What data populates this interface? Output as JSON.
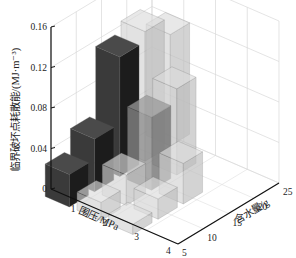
{
  "chart_data": {
    "type": "bar3d",
    "title": "",
    "ylabel": "临界破坏点耗散能/(MJ·m⁻³)",
    "xlabel": "围压/MPa",
    "zlabel": "含水量/g",
    "x_ticks": [
      "1",
      "2",
      "3",
      "4"
    ],
    "z_ticks": [
      "5",
      "10",
      "15",
      "20",
      "25"
    ],
    "y_ticks": [
      "0",
      "0.04",
      "0.08",
      "0.12",
      "0.16"
    ],
    "ylim": [
      0,
      0.16
    ],
    "grid": true,
    "bars": [
      {
        "pressure": 1,
        "water": 5,
        "value": 0.032,
        "shade": "dark"
      },
      {
        "pressure": 2,
        "water": 5,
        "value": 0.018,
        "shade": "light"
      },
      {
        "pressure": 3,
        "water": 5,
        "value": 0.01,
        "shade": "light"
      },
      {
        "pressure": 1,
        "water": 10,
        "value": 0.052,
        "shade": "dark"
      },
      {
        "pressure": 2,
        "water": 10,
        "value": 0.03,
        "shade": "light"
      },
      {
        "pressure": 3,
        "water": 10,
        "value": 0.02,
        "shade": "light"
      },
      {
        "pressure": 1,
        "water": 15,
        "value": 0.118,
        "shade": "dark"
      },
      {
        "pressure": 2,
        "water": 15,
        "value": 0.072,
        "shade": "medium"
      },
      {
        "pressure": 3,
        "water": 15,
        "value": 0.04,
        "shade": "light"
      },
      {
        "pressure": 1,
        "water": 20,
        "value": 0.128,
        "shade": "light"
      },
      {
        "pressure": 2,
        "water": 20,
        "value": 0.085,
        "shade": "light"
      },
      {
        "pressure": 1,
        "water": 25,
        "value": 0.11,
        "shade": "light"
      }
    ]
  },
  "labels": {
    "y_axis": "临界破坏点耗散能/(MJ·m⁻³)",
    "x_axis": "围压/MPa",
    "z_axis": "含水量/g"
  },
  "colors": {
    "dark": "#2e2e2e",
    "medium": "#7a7a7a",
    "light": "#c8c8c8",
    "grid": "#d9d9d9",
    "axis": "#111111"
  }
}
